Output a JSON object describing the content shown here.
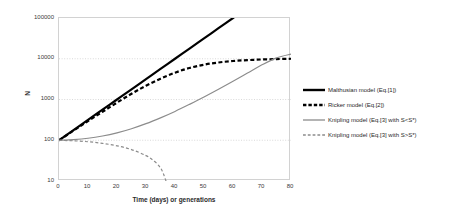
{
  "chart_data": {
    "type": "line",
    "title": "",
    "xlabel": "Time (days) or generations",
    "ylabel": "N",
    "yscale": "log",
    "ylim": [
      10,
      100000
    ],
    "xlim": [
      0,
      80
    ],
    "grid": true,
    "legend_position": "right",
    "y_ticks": [
      "100000",
      "10000",
      "1000",
      "100",
      "10"
    ],
    "y_tick_values": [
      100000,
      10000,
      1000,
      100,
      10
    ],
    "x_ticks": [
      "0",
      "10",
      "20",
      "30",
      "40",
      "50",
      "60",
      "70",
      "80"
    ],
    "x_tick_values": [
      0,
      10,
      20,
      30,
      40,
      50,
      60,
      70,
      80
    ],
    "series": [
      {
        "name": "Malthusian model (Eq.[1])",
        "style": "solid",
        "color": "#000000",
        "width": 2.2,
        "x": [
          0,
          5,
          10,
          15,
          20,
          25,
          30,
          35,
          40,
          45,
          50,
          55,
          60,
          65,
          70
        ],
        "y": [
          100,
          178,
          316,
          562,
          1000,
          1778,
          3162,
          5623,
          10000,
          17783,
          31623,
          56234,
          100000,
          177828,
          316228
        ]
      },
      {
        "name": "Ricker model (Eq.[2])",
        "style": "dashed",
        "color": "#000000",
        "width": 2.2,
        "x": [
          0,
          5,
          10,
          15,
          20,
          25,
          30,
          35,
          40,
          45,
          50,
          55,
          60,
          65,
          70,
          75,
          80
        ],
        "y": [
          100,
          172,
          295,
          500,
          840,
          1380,
          2180,
          3250,
          4550,
          5950,
          7150,
          8100,
          8800,
          9250,
          9600,
          9820,
          10000
        ]
      },
      {
        "name": "Knipling model (Eq.[3] with S<S*)",
        "style": "solid",
        "color": "#8c8c8c",
        "width": 1.2,
        "x": [
          0,
          5,
          10,
          15,
          20,
          25,
          30,
          35,
          40,
          45,
          50,
          55,
          60,
          65,
          70,
          75,
          80
        ],
        "y": [
          100,
          104,
          112,
          127,
          152,
          192,
          255,
          355,
          510,
          760,
          1150,
          1780,
          2800,
          4450,
          7100,
          10500,
          13000
        ]
      },
      {
        "name": "Knipling model (Eq.[3] with S>S*)",
        "style": "dashed",
        "color": "#8c8c8c",
        "width": 1.2,
        "x": [
          0,
          5,
          10,
          15,
          20,
          25,
          30,
          33,
          35,
          36,
          37
        ],
        "y": [
          100,
          97,
          92,
          84,
          73,
          59,
          42,
          30,
          21,
          15,
          9.5
        ]
      }
    ]
  },
  "legend": {
    "items": [
      {
        "label": "Malthusian model (Eq.[1])",
        "style": "solid",
        "color": "#000000",
        "width": 2.4
      },
      {
        "label": "Ricker model (Eq.[2])",
        "style": "dashed",
        "color": "#000000",
        "width": 2.4
      },
      {
        "label": "Knipling model (Eq.[3] with S<S*)",
        "style": "solid",
        "color": "#8c8c8c",
        "width": 1.3
      },
      {
        "label": "Knipling model (Eq.[3] with S>S*)",
        "style": "dashed",
        "color": "#8c8c8c",
        "width": 1.3
      }
    ]
  },
  "axes": {
    "y_title": "N",
    "x_title": "Time (days) or generations"
  },
  "colors": {
    "frame": "#d2d2d2",
    "grid": "#cfcfcf",
    "black_series": "#000000",
    "grey_series": "#8c8c8c",
    "text": "#2b2b2b"
  }
}
